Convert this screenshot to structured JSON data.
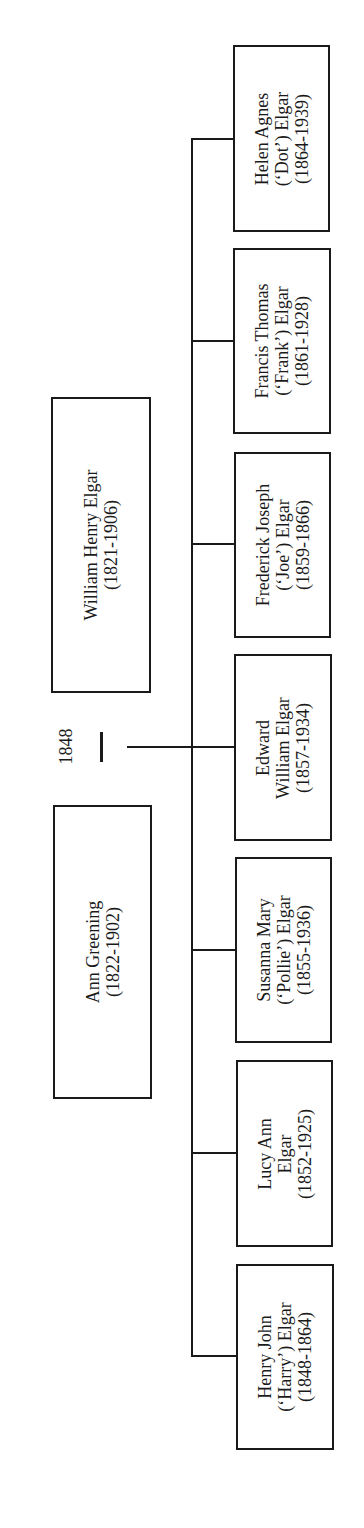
{
  "diagram": {
    "type": "family-tree",
    "orientation": "rotated-90-ccw",
    "marriage": {
      "year": "1848"
    },
    "parents": [
      {
        "id": "william",
        "lines": [
          "William Henry Elgar",
          "(1821-1906)"
        ]
      },
      {
        "id": "ann",
        "lines": [
          "Ann Greening",
          "(1822-1902)"
        ]
      }
    ],
    "children": [
      {
        "id": "helen",
        "lines": [
          "Helen Agnes",
          "(‘Dot’) Elgar",
          "(1864-1939)"
        ]
      },
      {
        "id": "francis",
        "lines": [
          "Francis Thomas",
          "(‘Frank’) Elgar",
          "(1861-1928)"
        ]
      },
      {
        "id": "frederick",
        "lines": [
          "Frederick Joseph",
          "(‘Joe’) Elgar",
          "(1859-1866)"
        ]
      },
      {
        "id": "edward",
        "lines": [
          "Edward",
          "William Elgar",
          "(1857-1934)"
        ]
      },
      {
        "id": "susanna",
        "lines": [
          "Susanna Mary",
          "(‘Pollie’) Elgar",
          "(1855-1936)"
        ]
      },
      {
        "id": "lucy",
        "lines": [
          "Lucy Ann",
          "Elgar",
          "(1852-1925)"
        ]
      },
      {
        "id": "henry",
        "lines": [
          "Henry John",
          "(‘Harry’) Elgar",
          "(1848-1864)"
        ]
      }
    ]
  }
}
